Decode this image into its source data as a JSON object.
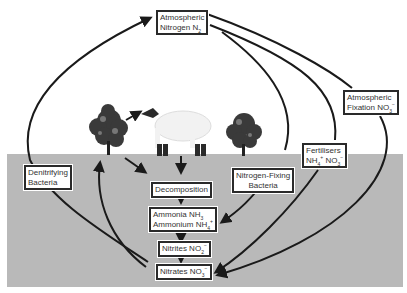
{
  "nodes": {
    "atmospheric_nitrogen": {
      "line1": "Atmospheric",
      "line2": "Nitrogen N",
      "sub": "2"
    },
    "atmospheric_fixation": {
      "line1": "Atmospheric",
      "line2": "Fixation NO",
      "sub": "3",
      "sup": "−"
    },
    "fertilisers": {
      "line1": "Fertilisers",
      "line2a": "NH",
      "sub_a": "4",
      "sup_a": "+",
      "line2b": " NO",
      "sub_b": "3",
      "sup_b": "−"
    },
    "nitrogen_fixing_bacteria": {
      "line1": "Nitrogen-Fixing",
      "line2": "Bacteria"
    },
    "denitrifying_bacteria": {
      "line1": "Denitrifying",
      "line2": "Bacteria"
    },
    "decomposition": {
      "label": "Decomposition"
    },
    "ammonia": {
      "line1": "Ammonia NH",
      "sub1": "3",
      "line2": "Ammonium NH",
      "sub2": "4",
      "sup2": "+"
    },
    "nitrites": {
      "label": "Nitrites NO",
      "sub": "2",
      "sup": "−"
    },
    "nitrates": {
      "label": "Nitrates NO",
      "sub": "3",
      "sup": "−"
    }
  },
  "illustrations": [
    "tree-left",
    "sheep",
    "tree-right"
  ],
  "colors": {
    "soil": "#b9b9b9",
    "arrow": "#1a1a1a",
    "box_border": "#2a2a2a"
  }
}
